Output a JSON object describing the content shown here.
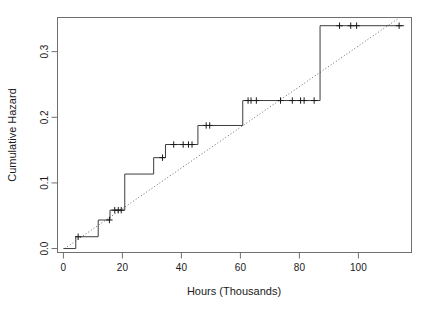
{
  "chart_data": {
    "type": "line",
    "subtype": "step-nelson-aalen-cumulative-hazard",
    "title": "",
    "xlabel": "Hours (Thousands)",
    "ylabel": "Cumulative Hazard",
    "xlim": [
      -2,
      118
    ],
    "ylim": [
      -0.006,
      0.352
    ],
    "xticks": [
      0,
      20,
      40,
      60,
      80,
      100
    ],
    "xticklabels": [
      "0",
      "20",
      "40",
      "60",
      "80",
      "100"
    ],
    "yticks": [
      0.0,
      0.1,
      0.2,
      0.3
    ],
    "yticklabels": [
      "0.0",
      "0.1",
      "0.2",
      "0.3"
    ],
    "grid": false,
    "legend": false,
    "frame": true,
    "series": [
      {
        "name": "Cumulative hazard (step)",
        "style": "step-post",
        "color": "#3d3d3d",
        "x": [
          0,
          4.2,
          11.8,
          15.8,
          20.8,
          30.6,
          34.6,
          45.6,
          60.8,
          87.0,
          115.5
        ],
        "y": [
          0.0,
          0.018,
          0.0435,
          0.0585,
          0.1135,
          0.1385,
          0.1585,
          0.1875,
          0.2255,
          0.3395,
          0.3395
        ]
      },
      {
        "name": "Reference line (dotted)",
        "style": "dotted",
        "color": "#6b6b6b",
        "x": [
          0.4,
          114.0
        ],
        "y": [
          0.0,
          0.352
        ]
      }
    ],
    "censor_marks": {
      "name": "Censored observations",
      "glyph": "+",
      "color": "#1a1a1a",
      "points": [
        {
          "x": 5.0,
          "y": 0.018
        },
        {
          "x": 15.6,
          "y": 0.0435
        },
        {
          "x": 17.4,
          "y": 0.0585
        },
        {
          "x": 18.6,
          "y": 0.0585
        },
        {
          "x": 19.6,
          "y": 0.0585
        },
        {
          "x": 33.6,
          "y": 0.1385
        },
        {
          "x": 37.4,
          "y": 0.1585
        },
        {
          "x": 40.6,
          "y": 0.1585
        },
        {
          "x": 42.4,
          "y": 0.1585
        },
        {
          "x": 43.6,
          "y": 0.1585
        },
        {
          "x": 48.4,
          "y": 0.1875
        },
        {
          "x": 49.6,
          "y": 0.1875
        },
        {
          "x": 62.6,
          "y": 0.2255
        },
        {
          "x": 63.6,
          "y": 0.2255
        },
        {
          "x": 65.4,
          "y": 0.2255
        },
        {
          "x": 73.6,
          "y": 0.2255
        },
        {
          "x": 77.6,
          "y": 0.2255
        },
        {
          "x": 80.4,
          "y": 0.2255
        },
        {
          "x": 81.6,
          "y": 0.2255
        },
        {
          "x": 85.0,
          "y": 0.2255
        },
        {
          "x": 93.6,
          "y": 0.3395
        },
        {
          "x": 97.4,
          "y": 0.3395
        },
        {
          "x": 99.4,
          "y": 0.3395
        },
        {
          "x": 113.8,
          "y": 0.3395
        }
      ]
    }
  },
  "axes": {
    "x_axis_title": "Hours (Thousands)",
    "y_axis_title": "Cumulative Hazard"
  },
  "colors": {
    "background": "#ffffff",
    "frame": "#6f6f6f",
    "step_line": "#3d3d3d",
    "dotted_line": "#6b6b6b",
    "text": "#1a1a1a"
  }
}
